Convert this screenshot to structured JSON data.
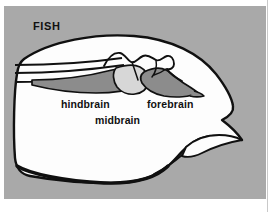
{
  "figure": {
    "title": "FISH",
    "labels": {
      "hindbrain": "hindbrain",
      "forebrain": "forebrain",
      "midbrain": "midbrain"
    },
    "colors": {
      "background_gray": "#a9a9a9",
      "page_white": "#ffffff",
      "head_fill": "#fdfdfd",
      "outline_black": "#101010",
      "brain_dark_gray": "#8c8c8c",
      "brain_mid_gray": "#bdbdbd",
      "brain_light_gray": "#d7d7d7",
      "text_black": "#111111",
      "rule_gray": "#c9c9c9"
    },
    "parts": [
      "spinal-cord-lines",
      "hindbrain-region",
      "midbrain-region",
      "forebrain-region",
      "head-outline",
      "mouth-line",
      "gill-line"
    ]
  }
}
